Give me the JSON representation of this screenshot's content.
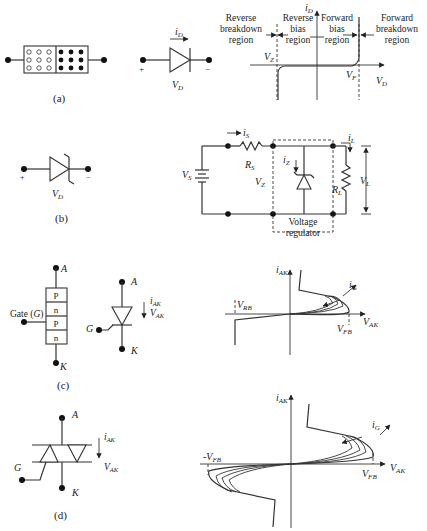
{
  "panels": {
    "a": {
      "caption": "(a)",
      "diode_current": "i",
      "diode_current_sub": "D",
      "diode_voltage": "V",
      "diode_voltage_sub": "D",
      "plus": "+",
      "minus": "−",
      "chart": {
        "y_axis": "i",
        "y_axis_sub": "D",
        "x_axis": "V",
        "x_axis_sub": "D",
        "vz": "V",
        "vz_sub": "Z",
        "vf": "V",
        "vf_sub": "F",
        "regions": [
          [
            "Reverse",
            "breakdown",
            "region"
          ],
          [
            "Reverse",
            "bias",
            "region"
          ],
          [
            "Forward",
            "bias",
            "region"
          ],
          [
            "Forward",
            "breakdown",
            "region"
          ]
        ]
      }
    },
    "b": {
      "caption": "(b)",
      "diode_voltage": "V",
      "diode_voltage_sub": "D",
      "plus": "+",
      "minus": "−",
      "circuit": {
        "is": "i",
        "is_sub": "S",
        "rs": "R",
        "rs_sub": "S",
        "vs": "V",
        "vs_sub": "S",
        "vz": "V",
        "vz_sub": "Z",
        "iz": "i",
        "iz_sub": "Z",
        "il": "i",
        "il_sub": "L",
        "rl": "R",
        "rl_sub": "L",
        "vl": "V",
        "vl_sub": "L",
        "regulator_line1": "Voltage",
        "regulator_line2": "regulator"
      }
    },
    "c": {
      "caption": "(c)",
      "anode": "A",
      "cathode": "K",
      "gate_label": "Gate (",
      "gate_g": "G",
      "gate_close": ")",
      "layers": [
        "P",
        "n",
        "P",
        "n"
      ],
      "symbol_gate": "G",
      "iak": "i",
      "iak_sub": "AK",
      "vak": "V",
      "vak_sub": "AK",
      "chart": {
        "y_axis": "i",
        "y_axis_sub": "AK",
        "x_axis": "V",
        "x_axis_sub": "AK",
        "vrb": "V",
        "vrb_sub": "RB",
        "vfb": "V",
        "vfb_sub": "FB",
        "ig": "i",
        "ig_sub": "G"
      }
    },
    "d": {
      "caption": "(d)",
      "anode": "A",
      "cathode": "K",
      "gate": "G",
      "iak": "i",
      "iak_sub": "AK",
      "vak": "V",
      "vak_sub": "AK",
      "chart": {
        "y_axis": "i",
        "y_axis_sub": "AK",
        "x_axis": "V",
        "x_axis_sub": "AK",
        "neg_vfb": "-V",
        "neg_vfb_sub": "FB",
        "vfb": "V",
        "vfb_sub": "FB",
        "ig": "i",
        "ig_sub": "G"
      }
    }
  }
}
